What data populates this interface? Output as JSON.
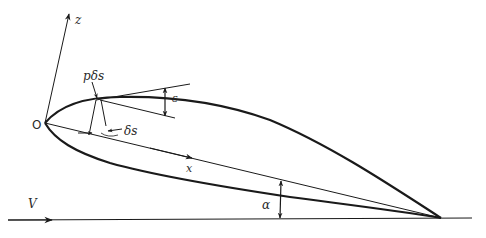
{
  "diagram": {
    "labels": {
      "origin": "O",
      "z_axis": "z",
      "x_axis": "x",
      "freestream": "V",
      "pressure_force": "pδs",
      "element_length": "δs",
      "surface_angle": "ε",
      "incidence_angle": "α"
    },
    "colors": {
      "ink": "#1a1a1a",
      "background": "#ffffff"
    }
  }
}
